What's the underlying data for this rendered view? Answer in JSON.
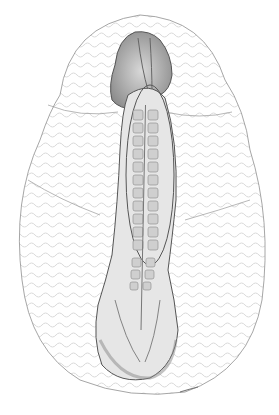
{
  "illustration": {
    "subject": "embryo-drawing",
    "colors": {
      "background": "#ffffff",
      "outline": "#555555",
      "texture": "#bdbdbd",
      "body_shade": "#8a8a8a",
      "somite": "#cfcfcf"
    },
    "somite_count": 14,
    "signature": ""
  }
}
